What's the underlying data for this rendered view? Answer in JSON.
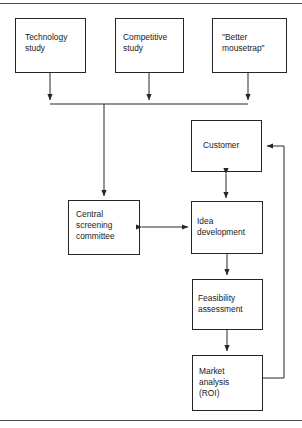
{
  "figure": {
    "type": "flowchart",
    "canvas": {
      "width": 302,
      "height": 428
    },
    "stroke_color": "#262626",
    "rule_color": "#4d4d4d",
    "background": "#ffffff",
    "text_color": "#1a1a1a"
  },
  "rules": [
    {
      "name": "top-rule",
      "y": 3
    },
    {
      "name": "bottom-rule",
      "y": 420
    }
  ],
  "nodes": [
    {
      "id": "technology-study",
      "label": "Technology\nstudy",
      "x": 15,
      "y": 18,
      "w": 70,
      "h": 54,
      "text_x": 25,
      "text_y": 32
    },
    {
      "id": "competitive-study",
      "label": "Competitive\nstudy",
      "x": 115,
      "y": 18,
      "w": 68,
      "h": 54,
      "text_x": 123,
      "text_y": 32
    },
    {
      "id": "better-mousetrap",
      "label": "\"Better\nmousetrap\"",
      "x": 212,
      "y": 18,
      "w": 74,
      "h": 54,
      "text_x": 222,
      "text_y": 32
    },
    {
      "id": "central-screening-committee",
      "label": "Central\nscreening\ncommittee",
      "x": 68,
      "y": 200,
      "w": 71,
      "h": 54,
      "text_x": 76,
      "text_y": 209
    },
    {
      "id": "customer",
      "label": "Customer",
      "x": 191,
      "y": 120,
      "w": 70,
      "h": 51,
      "text_x": 203,
      "text_y": 140
    },
    {
      "id": "idea-development",
      "label": "Idea\ndevelopment",
      "x": 191,
      "y": 201,
      "w": 71,
      "h": 52,
      "text_x": 197,
      "text_y": 216
    },
    {
      "id": "feasibility-assessment",
      "label": "Feasibility\nassessment",
      "x": 192,
      "y": 279,
      "w": 70,
      "h": 50,
      "text_x": 198,
      "text_y": 293
    },
    {
      "id": "market-analysis-roi",
      "label": "Market\nanalysis\n(ROI)",
      "x": 192,
      "y": 355,
      "w": 70,
      "h": 55,
      "text_x": 199,
      "text_y": 366
    }
  ],
  "connectors": [
    {
      "id": "technology-study-to-bus",
      "from": "technology-study",
      "to": "distribution-bus",
      "kind": "arrow-down",
      "path": "M50,72 L50,100",
      "arrowhead_at": [
        50,
        103
      ]
    },
    {
      "id": "competitive-study-to-bus",
      "from": "competitive-study",
      "to": "distribution-bus",
      "kind": "arrow-down",
      "path": "M149,72 L149,100",
      "arrowhead_at": [
        149,
        103
      ]
    },
    {
      "id": "better-mousetrap-to-bus",
      "from": "better-mousetrap",
      "to": "distribution-bus",
      "kind": "arrow-down",
      "path": "M248,72 L248,100",
      "arrowhead_at": [
        248,
        103
      ]
    },
    {
      "id": "distribution-bus",
      "kind": "bus-line",
      "path": "M50,104 L248,104"
    },
    {
      "id": "bus-to-central-screening",
      "from": "distribution-bus",
      "to": "central-screening-committee",
      "kind": "arrow-down",
      "path": "M104,104 L104,196",
      "arrowhead_at": [
        104,
        199
      ]
    },
    {
      "id": "central-screening-to-idea-development",
      "from": "central-screening-committee",
      "to": "idea-development",
      "kind": "arrow-both-horizontal",
      "path": "M142,227 L188,227"
    },
    {
      "id": "customer-to-idea-development",
      "from": "customer",
      "to": "idea-development",
      "kind": "arrow-both-vertical",
      "path": "M226,174 L226,198"
    },
    {
      "id": "idea-development-to-feasibility",
      "from": "idea-development",
      "to": "feasibility-assessment",
      "kind": "arrow-down",
      "path": "M227,253 L227,275",
      "arrowhead_at": [
        227,
        278
      ]
    },
    {
      "id": "feasibility-to-market-analysis",
      "from": "feasibility-assessment",
      "to": "market-analysis-roi",
      "kind": "arrow-down",
      "path": "M227,329 L227,351",
      "arrowhead_at": [
        227,
        354
      ]
    },
    {
      "id": "market-analysis-to-customer-feedback",
      "from": "market-analysis-roi",
      "to": "customer",
      "kind": "arrow-feedback-loop",
      "path": "M262,378 L284,378 L284,146 L267,146",
      "arrowhead_at": [
        263,
        146
      ]
    }
  ]
}
